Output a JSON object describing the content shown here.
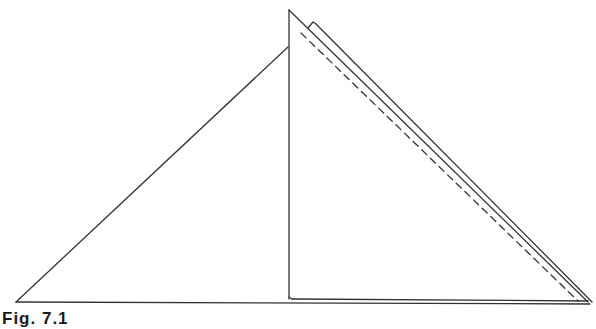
{
  "figure": {
    "caption": "Fig. 7.1",
    "stroke_color": "#333333",
    "background": "#ffffff"
  }
}
